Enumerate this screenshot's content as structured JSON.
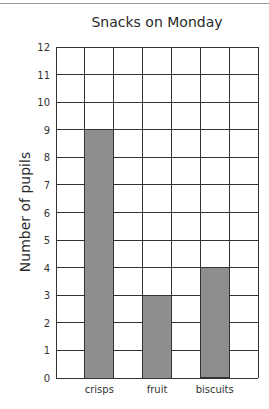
{
  "chart_data": {
    "type": "bar",
    "title": "Snacks on Monday",
    "xlabel": "",
    "ylabel": "Number of pupils",
    "categories": [
      "crisps",
      "fruit",
      "biscuits"
    ],
    "values": [
      9,
      3,
      4
    ],
    "ylim": [
      0,
      12
    ],
    "yticks": [
      0,
      1,
      2,
      3,
      4,
      5,
      6,
      7,
      8,
      9,
      10,
      11,
      12
    ],
    "grid": true,
    "grid_columns": 7,
    "bar_columns": [
      1,
      3,
      5
    ],
    "bar_color": "#8e8e8e",
    "grid_color": "#333333",
    "legend": null
  }
}
